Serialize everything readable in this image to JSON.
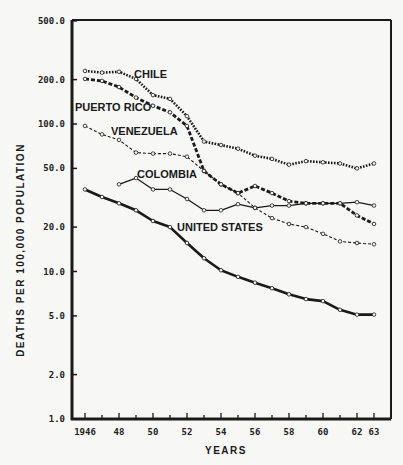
{
  "chart_data": {
    "type": "line",
    "title": "",
    "xlabel": "YEARS",
    "ylabel": "DEATHS PER 100,000 POPULATION",
    "yscale": "log",
    "ylim": [
      1.0,
      500.0
    ],
    "xlim": [
      1946,
      1963
    ],
    "y_ticks": [
      "500.0",
      "200.0",
      "100.0",
      "50.0",
      "20.0",
      "10.0",
      "5.0",
      "2.0",
      "1.0"
    ],
    "y_tick_values": [
      500,
      200,
      100,
      50,
      20,
      10,
      5,
      2,
      1
    ],
    "x_ticks": [
      "1946",
      "48",
      "50",
      "52",
      "54",
      "56",
      "58",
      "60",
      "62",
      "63"
    ],
    "x_tick_values": [
      1946,
      1948,
      1950,
      1952,
      1954,
      1956,
      1958,
      1960,
      1962,
      1963
    ],
    "grid": false,
    "legend": "inline labels",
    "series": [
      {
        "name": "CHILE",
        "style": "heavy-dotted",
        "x": [
          1946,
          1947,
          1948,
          1949,
          1950,
          1951,
          1952,
          1953,
          1954,
          1955,
          1956,
          1957,
          1958,
          1959,
          1960,
          1961,
          1962,
          1963
        ],
        "values": [
          229,
          223,
          226,
          202,
          157,
          148,
          113,
          76,
          72,
          68,
          61,
          58,
          53,
          56,
          55,
          54,
          50,
          54
        ]
      },
      {
        "name": "PUERTO RICO",
        "style": "heavy-dashed",
        "x": [
          1946,
          1947,
          1948,
          1949,
          1950,
          1951,
          1952,
          1953,
          1954,
          1955,
          1956,
          1957,
          1958,
          1959,
          1960,
          1961,
          1962,
          1963
        ],
        "values": [
          202,
          196,
          178,
          151,
          133,
          120,
          97,
          48,
          39,
          34,
          38,
          34,
          30,
          29,
          29,
          29,
          24,
          21
        ]
      },
      {
        "name": "VENEZUELA",
        "style": "thin-dashed",
        "x": [
          1946,
          1947,
          1948,
          1949,
          1950,
          1951,
          1952,
          1953,
          1954,
          1955,
          1956,
          1957,
          1958,
          1959,
          1960,
          1961,
          1962,
          1963
        ],
        "values": [
          97,
          85,
          78,
          64,
          63,
          63,
          60,
          48,
          39,
          34,
          27,
          23,
          21,
          20,
          18,
          16,
          15.6,
          15.3
        ]
      },
      {
        "name": "COLOMBIA",
        "style": "thin-solid",
        "x": [
          1948,
          1949,
          1950,
          1951,
          1952,
          1953,
          1954,
          1955,
          1956,
          1957,
          1958,
          1959,
          1960,
          1961,
          1962,
          1963
        ],
        "values": [
          39,
          43,
          36,
          36,
          31,
          26,
          26,
          28.6,
          27,
          28,
          28,
          29,
          29,
          29,
          29.5,
          28
        ]
      },
      {
        "name": "UNITED STATES",
        "style": "heavy-solid",
        "x": [
          1946,
          1947,
          1948,
          1949,
          1950,
          1951,
          1952,
          1953,
          1954,
          1955,
          1956,
          1957,
          1958,
          1959,
          1960,
          1961,
          1962,
          1963
        ],
        "values": [
          36,
          32,
          29,
          26,
          22,
          20,
          15.6,
          12.3,
          10.2,
          9.2,
          8.4,
          7.7,
          7.0,
          6.5,
          6.3,
          5.5,
          5.1,
          5.1
        ]
      }
    ],
    "label_positions": {
      "CHILE": [
        134,
        78
      ],
      "PUERTO RICO": [
        75,
        111
      ],
      "VENEZUELA": [
        111,
        135
      ],
      "COLOMBIA": [
        137,
        178
      ],
      "UNITED STATES": [
        177,
        231
      ]
    }
  },
  "colors": {
    "background": "#f7f7f5",
    "ink": "#1a1a1a"
  }
}
